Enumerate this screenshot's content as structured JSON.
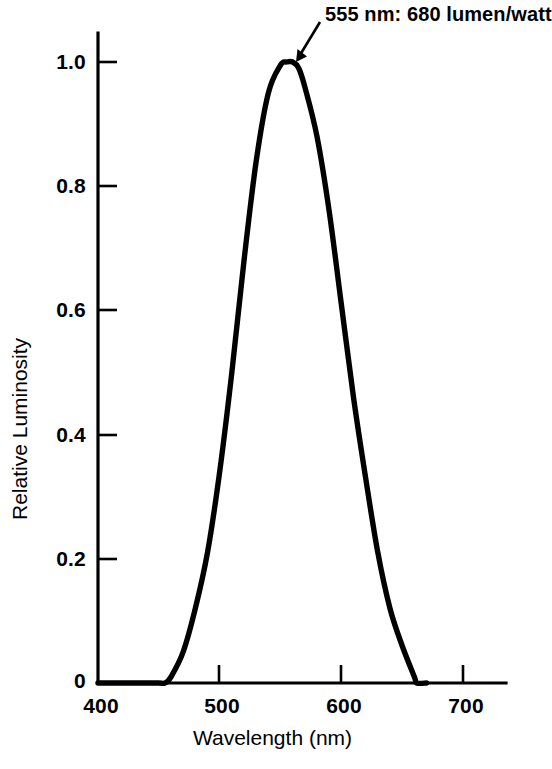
{
  "chart_data": {
    "type": "line",
    "title": "",
    "xlabel": "Wavelength (nm)",
    "ylabel": "Relative Luminosity",
    "xlim": [
      400,
      735
    ],
    "ylim": [
      0,
      1.06
    ],
    "grid": false,
    "legend": null,
    "x_ticks": [
      "400",
      "500",
      "600",
      "700"
    ],
    "x_tick_values": [
      400,
      500,
      600,
      700
    ],
    "y_ticks": [
      "0",
      "0.2",
      "0.4",
      "0.6",
      "0.8",
      "1.0"
    ],
    "y_tick_values": [
      0,
      0.2,
      0.4,
      0.6,
      0.8,
      1.0
    ],
    "series": [
      {
        "name": "Photopic luminosity function",
        "x": [
          400,
          410,
          420,
          430,
          440,
          450,
          455,
          460,
          470,
          480,
          490,
          500,
          510,
          520,
          530,
          540,
          550,
          555,
          560,
          565,
          570,
          580,
          590,
          600,
          610,
          620,
          630,
          640,
          650,
          660,
          662,
          670
        ],
        "values": [
          0.0,
          0.0,
          0.0,
          0.0,
          0.0,
          0.0,
          0.0,
          0.01,
          0.05,
          0.12,
          0.21,
          0.34,
          0.5,
          0.68,
          0.84,
          0.95,
          0.995,
          1.0,
          1.0,
          0.99,
          0.96,
          0.88,
          0.76,
          0.61,
          0.46,
          0.33,
          0.21,
          0.12,
          0.06,
          0.01,
          0.0,
          0.0
        ]
      }
    ],
    "annotations": [
      {
        "name": "peak-annotation",
        "text": "555 nm: 680 lumen/watt",
        "point_x": 565,
        "point_y": 1.0,
        "arrow": true
      }
    ]
  },
  "axes": {
    "x_title": "Wavelength (nm)",
    "y_title": "Relative Luminosity",
    "x_tick_labels": [
      "400",
      "500",
      "600",
      "700"
    ],
    "y_tick_labels": [
      "1.0",
      "0.8",
      "0.6",
      "0.4",
      "0.2",
      "0"
    ]
  },
  "annotation": {
    "peak_text": "555 nm: 680 lumen/watt"
  },
  "colors": {
    "curve": "#000000",
    "axis": "#000000",
    "background": "#ffffff"
  }
}
